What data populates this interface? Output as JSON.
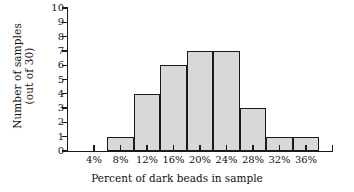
{
  "chart_data": {
    "type": "bar",
    "title": "",
    "xlabel": "Percent of dark beads in sample",
    "ylabel": "Number of samples (out of 30)",
    "ylabel_line1": "Number of samples",
    "ylabel_line2": "(out of 30)",
    "categories": [
      "4%",
      "8%",
      "12%",
      "16%",
      "20%",
      "24%",
      "28%",
      "32%",
      "36%"
    ],
    "values": [
      0,
      1,
      4,
      6,
      7,
      7,
      3,
      1,
      1
    ],
    "ylim": [
      0,
      10
    ],
    "yticks": [
      0,
      1,
      2,
      3,
      4,
      5,
      6,
      7,
      8,
      9,
      10
    ],
    "ytick_labels": [
      "0",
      "1",
      "2",
      "3",
      "4",
      "5",
      "6",
      "7",
      "8",
      "9",
      "10"
    ],
    "grid": false,
    "legend": "none",
    "bar_fill": "#d8d8d8",
    "bar_stroke": "#1b1b1b",
    "axis_color": "#1b1b1b",
    "background": "#ffffff"
  }
}
